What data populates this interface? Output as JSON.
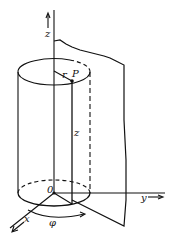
{
  "diagram": {
    "labels": {
      "z_axis": "z",
      "z_height": "z",
      "r": "r",
      "point": "P",
      "origin": "0",
      "x_axis": "x",
      "y_axis": "y",
      "phi": "φ"
    },
    "colors": {
      "ink": "#111111",
      "background": "#ffffff"
    }
  }
}
